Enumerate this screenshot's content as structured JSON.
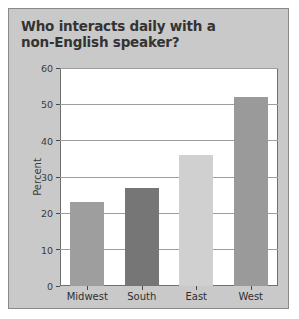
{
  "figure": {
    "background_color": "#c9c9c9",
    "border_color": "#8a8a8a",
    "plot_background_color": "#ffffff",
    "gridline_color": "#9d9d9d"
  },
  "title_line_1": "Who interacts daily with a",
  "title_line_2": "non-English speaker?",
  "chart_data": {
    "type": "bar",
    "title": "Who interacts daily with a non-English speaker?",
    "xlabel": "",
    "ylabel": "Percent",
    "categories": [
      "Midwest",
      "South",
      "East",
      "West"
    ],
    "values": [
      23,
      27,
      36,
      52
    ],
    "series": [
      {
        "name": "Percent",
        "values": [
          23,
          27,
          36,
          52
        ]
      }
    ],
    "bar_colors": [
      "#9e9e9e",
      "#767676",
      "#d0d0d0",
      "#9a9a9a"
    ],
    "ylim": [
      0,
      60
    ],
    "yticks": [
      0,
      10,
      20,
      30,
      40,
      50,
      60
    ],
    "ytick_labels": [
      "0",
      "10",
      "20",
      "30",
      "40",
      "50",
      "60"
    ],
    "grid": true,
    "grid_axis": "y",
    "legend": false,
    "legend_position": "none"
  }
}
